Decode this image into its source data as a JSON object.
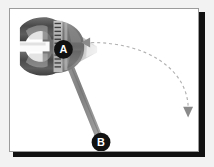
{
  "figure": {
    "background_color": "#ffffff",
    "mat_color": "#f2f2f2",
    "frame_border_color": "#9b9b9b",
    "shadow_color": "#111111"
  },
  "markers": [
    {
      "id": "A",
      "label": "A",
      "role": "pivot-point",
      "cx": 54,
      "cy": 41,
      "r": 9,
      "fill": "#111111",
      "text_color": "#ffffff"
    },
    {
      "id": "B",
      "label": "B",
      "role": "force-application-point",
      "cx": 92,
      "cy": 135,
      "r": 9,
      "fill": "#111111",
      "text_color": "#ffffff"
    }
  ],
  "handle": {
    "name": "wrench-handle",
    "from": {
      "x": 54,
      "y": 41
    },
    "to": {
      "x": 92,
      "y": 135
    },
    "stroke": "#8c8c8c",
    "width": 6
  },
  "rotation_arrow": {
    "name": "rotation-direction-arrow",
    "style": "dashed",
    "stroke": "#b0b0b0",
    "width": 1.2,
    "dash": "3 3",
    "start": {
      "x": 82,
      "y": 34
    },
    "control1": {
      "x": 140,
      "y": 34
    },
    "control2": {
      "x": 178,
      "y": 62
    },
    "end": {
      "x": 180,
      "y": 98
    },
    "start_arrowhead": {
      "x": 80,
      "y": 34,
      "direction": "left",
      "fill": "#8c8c8c"
    },
    "end_arrowhead": {
      "x": 180,
      "y": 106,
      "direction": "down",
      "fill": "#8c8c8c"
    }
  },
  "wrench": {
    "name": "pipe-wrench-head",
    "body_fill_dark": "#4f4f4f",
    "body_fill_mid": "#7d7d7d",
    "body_fill_light": "#b5b5b5",
    "body_fill_pale": "#d8d8d8",
    "highlight": "#ececec",
    "teeth_color": "#3a3a3a"
  }
}
